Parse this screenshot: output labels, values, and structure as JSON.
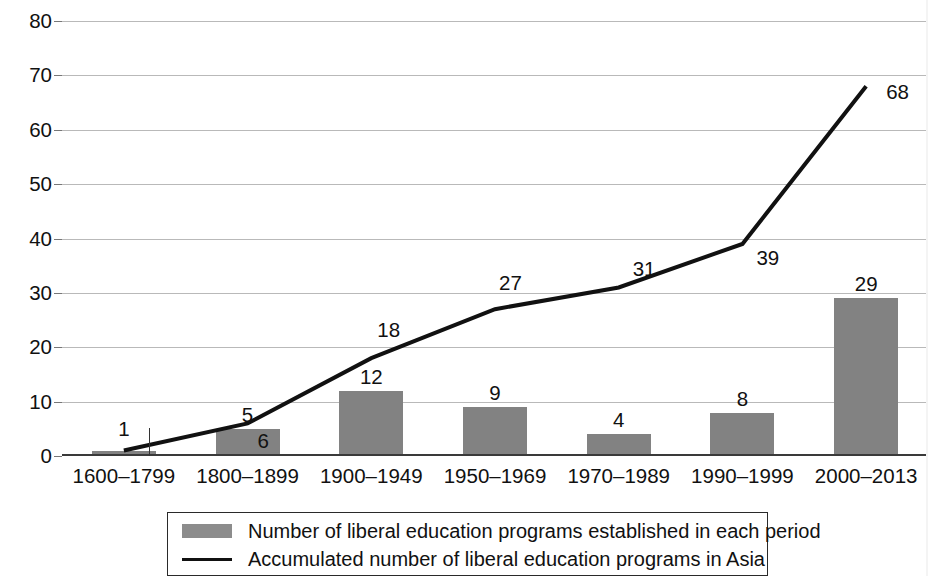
{
  "chart_data": {
    "type": "bar",
    "title": "",
    "subtitle": "",
    "xlabel": "",
    "ylabel": "",
    "ylim": [
      0,
      80
    ],
    "ytick_step": 10,
    "yticks": [
      "0",
      "10",
      "20",
      "30",
      "40",
      "50",
      "60",
      "70",
      "80"
    ],
    "grid": true,
    "legend_position": "bottom-center",
    "categories": [
      "1600–1799",
      "1800–1899",
      "1900–1949",
      "1950–1969",
      "1970–1989",
      "1990–1999",
      "2000–2013"
    ],
    "series": [
      {
        "name": "Number of liberal education programs established in each period",
        "type": "bar",
        "color": "#828282",
        "values": [
          1,
          5,
          12,
          9,
          4,
          8,
          29
        ],
        "labels": [
          "1",
          "5",
          "12",
          "9",
          "4",
          "8",
          "29"
        ]
      },
      {
        "name": "Accumulated number of liberal education programs in Asia",
        "type": "line",
        "color": "#111111",
        "values": [
          1,
          6,
          18,
          27,
          31,
          39,
          68
        ],
        "labels": [
          "1",
          "6",
          "18",
          "27",
          "31",
          "39",
          "68"
        ]
      }
    ]
  },
  "legend": {
    "entries": [
      {
        "marker": "bar-swatch",
        "label": "Number of liberal education programs established in each period"
      },
      {
        "marker": "line-swatch",
        "label": "Accumulated number of liberal education programs in Asia"
      }
    ]
  },
  "colors": {
    "bar_fill": "#828282",
    "line_stroke": "#111111",
    "gridline": "#b9b9b9",
    "axis": "#3a3a3a",
    "text": "#111111",
    "background": "#ffffff"
  }
}
